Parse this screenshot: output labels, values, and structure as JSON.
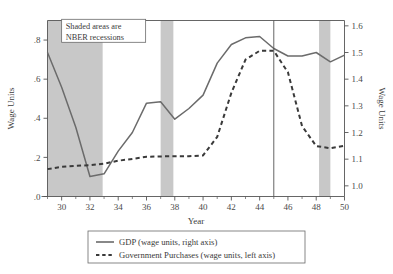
{
  "chart_data": {
    "type": "line",
    "title": "",
    "xlabel": "Year",
    "ylabel_left": "Wage Units",
    "ylabel_right": "Wage Units",
    "xlim": [
      29,
      50
    ],
    "ylim_left": [
      0.0,
      0.9
    ],
    "ylim_right": [
      0.96,
      1.62
    ],
    "xticks": [
      30,
      32,
      34,
      36,
      38,
      40,
      42,
      44,
      46,
      48,
      50
    ],
    "xtick_labels": [
      "30",
      "32",
      "34",
      "36",
      "38",
      "40",
      "42",
      "44",
      "46",
      "48",
      "50"
    ],
    "yticks_left": [
      0.0,
      0.2,
      0.4,
      0.6,
      0.8
    ],
    "ytick_labels_left": [
      ".0",
      ".2",
      ".4",
      ".6",
      ".8"
    ],
    "yticks_right": [
      1.0,
      1.1,
      1.2,
      1.3,
      1.4,
      1.5,
      1.6
    ],
    "ytick_labels_right": [
      "1.0",
      "1.1",
      "1.2",
      "1.3",
      "1.4",
      "1.5",
      "1.6"
    ],
    "grid": false,
    "legend_position": "below",
    "x": [
      29,
      30,
      31,
      32,
      33,
      34,
      35,
      36,
      37,
      38,
      39,
      40,
      41,
      42,
      43,
      44,
      45,
      46,
      47,
      48,
      49,
      50
    ],
    "series": [
      {
        "name": "GDP (wage units, right axis)",
        "axis": "right",
        "style": "solid",
        "color": "#6b6b6b",
        "values": [
          1.5,
          1.37,
          1.22,
          1.035,
          1.045,
          1.13,
          1.2,
          1.31,
          1.315,
          1.25,
          1.29,
          1.34,
          1.46,
          1.53,
          1.555,
          1.56,
          1.515,
          1.487,
          1.487,
          1.5,
          1.465,
          1.49
        ]
      },
      {
        "name": "Government Purchases (wage units, left axis)",
        "axis": "left",
        "style": "dashed",
        "color": "#3a3a3a",
        "values": [
          0.14,
          0.152,
          0.157,
          0.16,
          0.168,
          0.183,
          0.192,
          0.203,
          0.205,
          0.206,
          0.206,
          0.21,
          0.305,
          0.53,
          0.7,
          0.745,
          0.745,
          0.635,
          0.36,
          0.258,
          0.247,
          0.26
        ]
      }
    ],
    "recession_bands": [
      {
        "start": 29.0,
        "end": 32.9
      },
      {
        "start": 37.0,
        "end": 37.9
      },
      {
        "start": 48.2,
        "end": 49.0
      }
    ],
    "vertical_marker": 45,
    "band_color": "#c8c8c8",
    "annotations": [
      {
        "lines": [
          "Shaded areas are",
          "NBER recessions"
        ],
        "x": 30.0,
        "y_left": 0.855
      }
    ]
  },
  "legend": {
    "entries": [
      {
        "label": "GDP (wage units, right axis)",
        "style": "solid"
      },
      {
        "label": "Government Purchases (wage units, left axis)",
        "style": "dashed"
      }
    ]
  }
}
